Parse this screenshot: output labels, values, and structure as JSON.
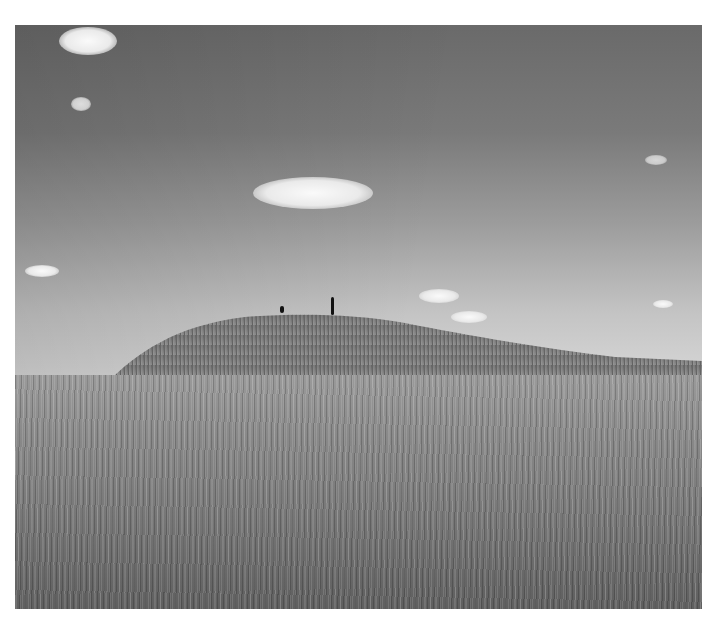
{
  "image": {
    "description": "Black-and-white landscape photograph of a grassy burial mound on open prairie under a sky with scattered small clouds; two tiny human figures walk along the top of the mound.",
    "style": "monochrome",
    "subjects": {
      "sky": "gradient grey sky, darker at top-left, lighter near horizon",
      "clouds": [
        "small cloud top-left",
        "small wisp left",
        "central cumulus cloud",
        "small cloud far left",
        "small clouds right near horizon",
        "wisps upper right"
      ],
      "mound": "grass-covered hill rising left-center and sloping off to the right",
      "figures": [
        "small figure (child) on mound top",
        "walking adult figure on mound top"
      ],
      "foreground": "tall dry prairie grass"
    },
    "colors": {
      "sky_top": "#6a6a6a",
      "sky_horizon": "#d8d8d8",
      "grass_dark": "#5f5f5f",
      "grass_light": "#9a9a9a",
      "background": "#ffffff"
    }
  }
}
